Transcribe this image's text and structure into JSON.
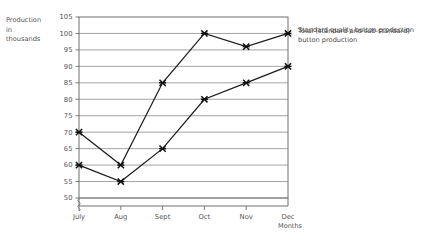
{
  "chart_data": {
    "type": "line",
    "title": "",
    "xlabel": "Months",
    "ylabel": "Production in thousands",
    "ylabel_lines": [
      "Production",
      "in",
      "thousands"
    ],
    "categories": [
      "July",
      "Aug",
      "Sept",
      "Oct",
      "Nov",
      "Dec"
    ],
    "ylim": [
      50,
      105
    ],
    "ytick_step": 5,
    "ytick_labels": [
      "105",
      "100",
      "95",
      "90",
      "85",
      "80",
      "75",
      "70",
      "65",
      "60",
      "55",
      "50"
    ],
    "ytick_values": [
      105,
      100,
      95,
      90,
      85,
      80,
      75,
      70,
      65,
      60,
      55,
      50
    ],
    "grid": true,
    "legend_position": "right-of-endpoints",
    "axis_break": true,
    "marker": "cross",
    "series": [
      {
        "name": "Total (standard and sub-standard) button production",
        "legend_lines": [
          "Total (standard and sub-standard)",
          "button production"
        ],
        "values": [
          70,
          60,
          85,
          100,
          96,
          100
        ],
        "color": "#1c1c1c"
      },
      {
        "name": "Standard quality button production",
        "legend_lines": [
          "Standard quality button production"
        ],
        "values": [
          60,
          55,
          65,
          80,
          85,
          90
        ],
        "color": "#1c1c1c"
      }
    ]
  },
  "colors": {
    "background": "#ffffff",
    "gridline": "#8d8d8d",
    "axis": "#6f6f6f",
    "series": "#1c1c1c",
    "text": "#555555"
  }
}
